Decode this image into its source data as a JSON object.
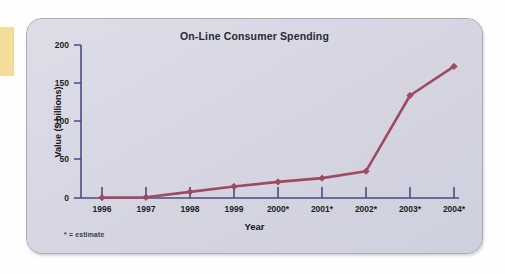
{
  "panel": {
    "background_color": "#d6d7e2",
    "border_color": "#a9aab8"
  },
  "side_strip": {
    "name": "yellow-marker-strip",
    "color": "#f5dc9a"
  },
  "chart_data": {
    "type": "line",
    "title": "On-Line Consumer Spending",
    "xlabel": "Year",
    "ylabel": "Value ($ billions)",
    "categories": [
      "1996",
      "1997",
      "1998",
      "1999",
      "2000*",
      "2001*",
      "2002*",
      "2003*",
      "2004*"
    ],
    "values": [
      0.5,
      1,
      8,
      15,
      21,
      26,
      35,
      134,
      172
    ],
    "ylim": [
      0,
      200
    ],
    "yticks": [
      0,
      50,
      100,
      150,
      200
    ],
    "ytick_labels": [
      "0",
      "50",
      "100",
      "150",
      "200"
    ],
    "grid": false,
    "legend": "none",
    "series_color": "#9e4a63",
    "axis_color": "#4a4a86",
    "marker": "diamond",
    "annotation": "* = estimate"
  }
}
